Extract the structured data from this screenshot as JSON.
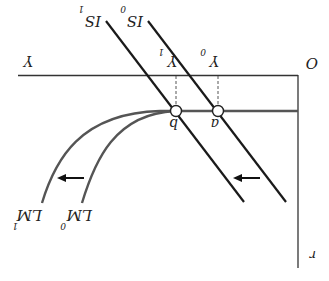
{
  "diagram": {
    "orientation": "rotated 180 degrees",
    "axes": {
      "origin_label": "O",
      "x_label": "Y",
      "y_label": "r"
    },
    "curves": {
      "is0_label": "IS",
      "is0_sub": "0",
      "is1_label": "IS",
      "is1_sub": "1",
      "lm0_label": "LM",
      "lm0_sub": "0",
      "lm1_label": "LM",
      "lm1_sub": "1"
    },
    "points": {
      "a_label": "a",
      "b_label": "b"
    },
    "ticks": {
      "y0_label": "Y",
      "y0_sub": "0",
      "y1_label": "Y",
      "y1_sub": "1"
    },
    "colors": {
      "axis": "#333333",
      "is": "#1a1a1a",
      "lm": "#555555",
      "arrow": "#111111"
    }
  }
}
